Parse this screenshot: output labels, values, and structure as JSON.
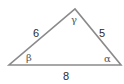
{
  "diagram": {
    "type": "triangle",
    "vertices": {
      "left": {
        "x": 9,
        "y": 65
      },
      "right": {
        "x": 121,
        "y": 65
      },
      "apex": {
        "x": 75,
        "y": 9
      }
    },
    "sides": {
      "left": "6",
      "right": "5",
      "bottom": "8"
    },
    "angles": {
      "apex": "γ",
      "left": "β",
      "right": "α"
    },
    "colors": {
      "stroke": "#8a8a8a",
      "text": "#2a2a2a",
      "angle_text": "#555555"
    }
  }
}
